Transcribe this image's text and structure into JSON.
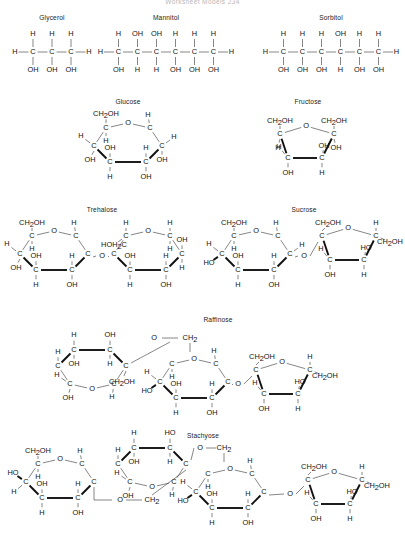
{
  "page": {
    "header": "Worksheet Models      234",
    "background": "#ffffff",
    "bond_color": "#3a3a3a",
    "bold_bond_color": "#111111",
    "text_color": "#111111"
  },
  "molecules": [
    {
      "id": "glycerol",
      "name": "Glycerol",
      "type": "open-chain-polyol",
      "carbons": 3,
      "top_substituents": [
        "H",
        "H",
        "H"
      ],
      "bottom_substituents": [
        "OH",
        "OH",
        "OH"
      ],
      "left_terminal": "H",
      "right_terminal": "H",
      "box": {
        "x": 4,
        "y": 14,
        "w": 96,
        "h": 74
      }
    },
    {
      "id": "mannitol",
      "name": "Mannitol",
      "type": "open-chain-polyol",
      "carbons": 6,
      "top_substituents": [
        "H",
        "OH",
        "OH",
        "H",
        "H",
        "H"
      ],
      "bottom_substituents": [
        "OH",
        "H",
        "H",
        "OH",
        "OH",
        "OH"
      ],
      "left_terminal": "H",
      "right_terminal": "H",
      "box": {
        "x": 110,
        "y": 14,
        "w": 112,
        "h": 74
      }
    },
    {
      "id": "sorbitol",
      "name": "Sorbitol",
      "type": "open-chain-polyol",
      "carbons": 6,
      "top_substituents": [
        "H",
        "H",
        "H",
        "OH",
        "H",
        "H"
      ],
      "bottom_substituents": [
        "OH",
        "OH",
        "OH",
        "H",
        "OH",
        "OH"
      ],
      "left_terminal": "H",
      "right_terminal": "H",
      "box": {
        "x": 268,
        "y": 14,
        "w": 126,
        "h": 74
      }
    },
    {
      "id": "glucose",
      "name": "Glucose",
      "type": "pyranose-haworth",
      "rings": 1,
      "box": {
        "x": 68,
        "y": 98,
        "w": 120,
        "h": 98
      }
    },
    {
      "id": "fructose",
      "name": "Fructose",
      "type": "furanose-haworth",
      "rings": 1,
      "box": {
        "x": 240,
        "y": 98,
        "w": 136,
        "h": 98
      }
    },
    {
      "id": "trehalose",
      "name": "Trehalose",
      "type": "disaccharide",
      "rings": 2,
      "linkage": "alpha,alpha-1,1 glycosidic",
      "box": {
        "x": 2,
        "y": 206,
        "w": 200,
        "h": 104
      }
    },
    {
      "id": "sucrose",
      "name": "Sucrose",
      "type": "disaccharide",
      "rings": 2,
      "linkage": "alpha-1,2 glycosidic",
      "box": {
        "x": 204,
        "y": 206,
        "w": 200,
        "h": 104
      }
    },
    {
      "id": "raffinose",
      "name": "Raffinose",
      "type": "trisaccharide",
      "rings": 3,
      "box": {
        "x": 34,
        "y": 316,
        "w": 368,
        "h": 112
      }
    },
    {
      "id": "stachyose",
      "name": "Stachyose",
      "type": "tetrasaccharide",
      "rings": 4,
      "box": {
        "x": 2,
        "y": 432,
        "w": 402,
        "h": 112
      }
    }
  ],
  "labels": {
    "H": "H",
    "O": "O",
    "C": "C",
    "OH": "OH",
    "HO": "HO",
    "CH2": "CH",
    "CH2OH": "CH",
    "HOH2C": "HOH",
    "sub2": "2",
    "OH_tail": "OH",
    "C_tail": "C"
  },
  "chart_data": {
    "type": "table",
    "categories": [
      "Glycerol",
      "Mannitol",
      "Sorbitol",
      "Glucose",
      "Fructose",
      "Trehalose",
      "Sucrose",
      "Raffinose",
      "Stachyose"
    ],
    "values": [
      3,
      6,
      6,
      6,
      6,
      12,
      12,
      18,
      24
    ],
    "series": [
      {
        "name": "carbon atoms",
        "values": [
          3,
          6,
          6,
          6,
          6,
          12,
          12,
          18,
          24
        ]
      },
      {
        "name": "ring count",
        "values": [
          0,
          0,
          0,
          1,
          1,
          2,
          2,
          3,
          4
        ]
      }
    ],
    "xlabel": "Compound",
    "ylabel": "Carbon atoms",
    "grid": false,
    "legend": "none"
  }
}
